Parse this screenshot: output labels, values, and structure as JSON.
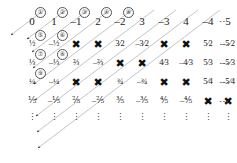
{
  "figure": {
    "line_color": "#9aa0a8",
    "cross_color": "#111111",
    "text_color": "#1a1a1a"
  },
  "chart_data": {
    "type": "table",
    "xlabel": "numerator",
    "ylabel": "denominator",
    "grid": false,
    "legend": "none",
    "columns": 11,
    "rows": 5,
    "numerators": [
      "0",
      "1",
      "−1",
      "2",
      "−2",
      "3",
      "−3",
      "4",
      "−4",
      "5",
      "−5"
    ],
    "denominators": [
      1,
      2,
      3,
      4,
      5
    ],
    "row_trailing": "⋯",
    "column_trailing": "⋮",
    "corner_trailing": "⋯",
    "cells": [
      [
        {
          "t": "0",
          "k": "num",
          "i": "①"
        },
        {
          "t": "1",
          "k": "num",
          "i": "②"
        },
        {
          "t": "–1",
          "k": "num",
          "i": "③"
        },
        {
          "t": "2",
          "k": "num",
          "i": "④"
        },
        {
          "t": "–2",
          "k": "num",
          "i": "⑧"
        },
        {
          "t": "3",
          "k": "num",
          "i": ""
        },
        {
          "t": "–3",
          "k": "num",
          "i": ""
        },
        {
          "t": "4",
          "k": "num",
          "i": ""
        },
        {
          "t": "–4",
          "k": "num",
          "i": ""
        },
        {
          "t": "5",
          "k": "num",
          "i": ""
        },
        {
          "t": "–5",
          "k": "num",
          "i": ""
        }
      ],
      [
        {
          "t": "½",
          "k": "frac",
          "i": "⑤"
        },
        {
          "t": "–½",
          "k": "frac",
          "i": "⑥"
        },
        {
          "t": "",
          "k": "cross",
          "i": ""
        },
        {
          "t": "",
          "k": "cross",
          "i": ""
        },
        {
          "t": "3⁄2",
          "k": "frac",
          "i": ""
        },
        {
          "t": "–3⁄2",
          "k": "frac",
          "i": ""
        },
        {
          "t": "",
          "k": "cross",
          "i": ""
        },
        {
          "t": "",
          "k": "cross",
          "i": ""
        },
        {
          "t": "5⁄2",
          "k": "frac",
          "i": ""
        },
        {
          "t": "–5⁄2",
          "k": "frac",
          "i": ""
        },
        {
          "t": "",
          "k": "pad",
          "i": ""
        }
      ],
      [
        {
          "t": "⅓",
          "k": "frac",
          "i": "⑦"
        },
        {
          "t": "–⅓",
          "k": "frac",
          "i": "⑧"
        },
        {
          "t": "⅔",
          "k": "frac",
          "i": ""
        },
        {
          "t": "–⅔",
          "k": "frac",
          "i": ""
        },
        {
          "t": "",
          "k": "cross",
          "i": ""
        },
        {
          "t": "",
          "k": "cross",
          "i": ""
        },
        {
          "t": "4⁄3",
          "k": "frac",
          "i": ""
        },
        {
          "t": "–4⁄3",
          "k": "frac",
          "i": ""
        },
        {
          "t": "5⁄3",
          "k": "frac",
          "i": ""
        },
        {
          "t": "–5⁄3",
          "k": "frac",
          "i": ""
        },
        {
          "t": "",
          "k": "pad",
          "i": ""
        }
      ],
      [
        {
          "t": "¼",
          "k": "frac",
          "i": "⑨"
        },
        {
          "t": "–¼",
          "k": "frac",
          "i": ""
        },
        {
          "t": "",
          "k": "cross",
          "i": ""
        },
        {
          "t": "",
          "k": "cross",
          "i": ""
        },
        {
          "t": "¾",
          "k": "frac",
          "i": ""
        },
        {
          "t": "–¾",
          "k": "frac",
          "i": ""
        },
        {
          "t": "",
          "k": "cross",
          "i": ""
        },
        {
          "t": "",
          "k": "cross",
          "i": ""
        },
        {
          "t": "5⁄4",
          "k": "frac",
          "i": ""
        },
        {
          "t": "–5⁄4",
          "k": "frac",
          "i": ""
        },
        {
          "t": "",
          "k": "pad",
          "i": ""
        }
      ],
      [
        {
          "t": "⅕",
          "k": "frac",
          "i": ""
        },
        {
          "t": "–⅕",
          "k": "frac",
          "i": ""
        },
        {
          "t": "⅖",
          "k": "frac",
          "i": ""
        },
        {
          "t": "–⅖",
          "k": "frac",
          "i": ""
        },
        {
          "t": "⅗",
          "k": "frac",
          "i": ""
        },
        {
          "t": "–⅗",
          "k": "frac",
          "i": ""
        },
        {
          "t": "⅘",
          "k": "frac",
          "i": ""
        },
        {
          "t": "–⅘",
          "k": "frac",
          "i": ""
        },
        {
          "t": "",
          "k": "cross",
          "i": ""
        },
        {
          "t": "",
          "k": "cross",
          "i": ""
        },
        {
          "t": "",
          "k": "pad",
          "i": ""
        }
      ]
    ],
    "cross_glyph": "✖",
    "enumeration_order": [
      "①",
      "②",
      "③",
      "④",
      "⑤",
      "⑥",
      "⑦",
      "⑧",
      "⑨"
    ],
    "annotations": {
      "description": "Diagonal arrows traverse the array from upper right to lower left; reducible fractions are crossed out and skipped."
    },
    "geometry": {
      "col_x": [
        32,
        54,
        76,
        98,
        120,
        142,
        164,
        186,
        208,
        228,
        248
      ],
      "row_y": [
        22,
        45,
        64,
        83,
        102
      ],
      "dots_row_y": 118,
      "hdots_x": 224
    }
  }
}
